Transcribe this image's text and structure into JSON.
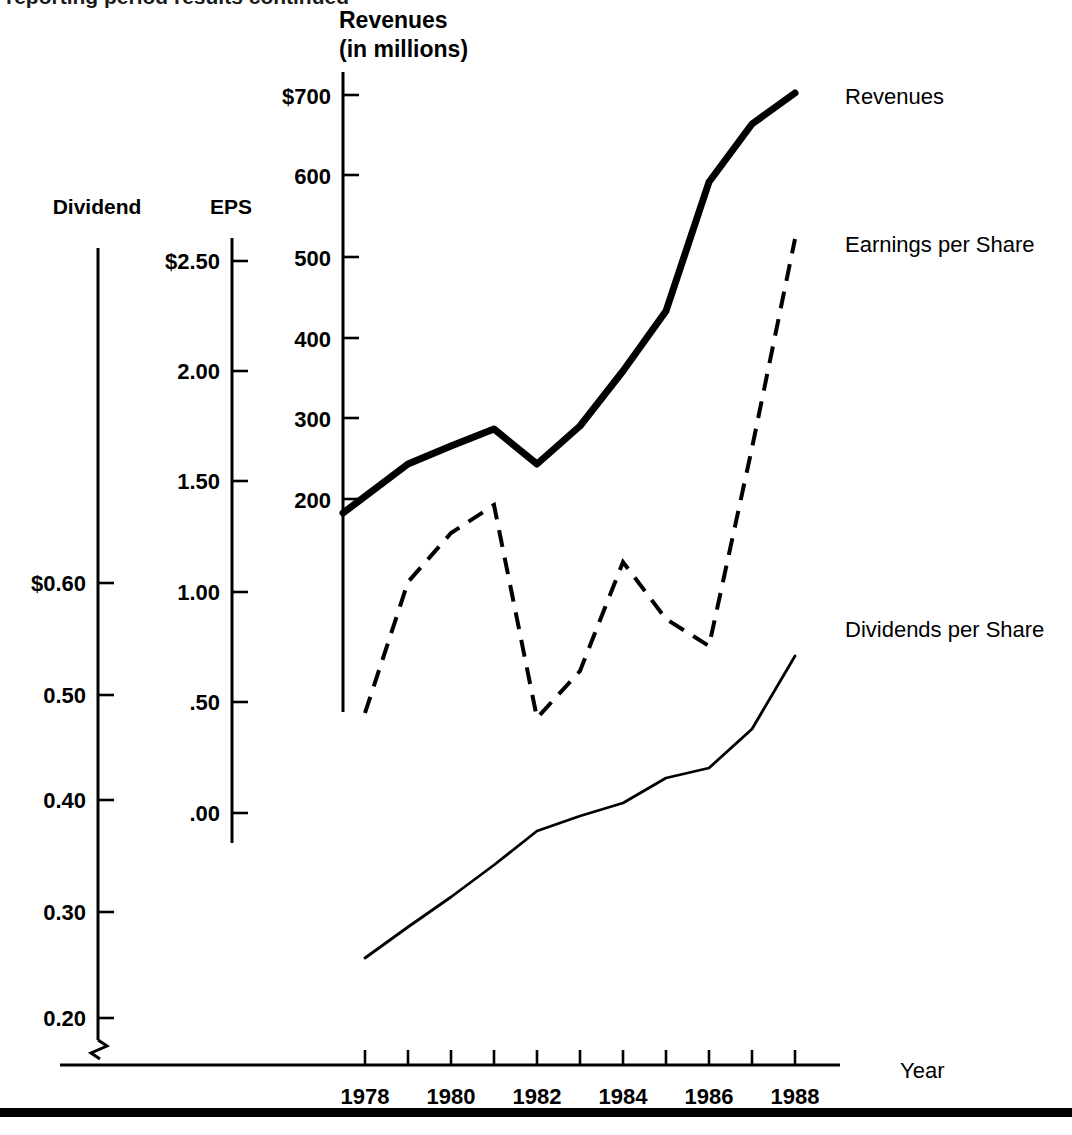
{
  "figure": {
    "background": "#ffffff",
    "ink_color": "#000000",
    "top_cropped_text": "reporting period results continued",
    "bottom_rule": {
      "y": 1108,
      "height": 9
    }
  },
  "axes": {
    "dividend": {
      "title": "Dividend",
      "title_x": 97,
      "title_y": 214,
      "axis_x": 98,
      "axis_top": 248,
      "axis_bottom": 1058,
      "has_break_symbol": true,
      "ticks": [
        {
          "label": "$0.60",
          "value": 0.6,
          "y": 583
        },
        {
          "label": "0.50",
          "value": 0.5,
          "y": 695
        },
        {
          "label": "0.40",
          "value": 0.4,
          "y": 800
        },
        {
          "label": "0.30",
          "value": 0.3,
          "y": 912
        },
        {
          "label": "0.20",
          "value": 0.2,
          "y": 1018
        }
      ]
    },
    "eps": {
      "title": "EPS",
      "title_x": 231,
      "title_y": 214,
      "axis_x": 232,
      "axis_top": 238,
      "axis_bottom": 843,
      "ticks": [
        {
          "label": "$2.50",
          "value": 2.5,
          "y": 261
        },
        {
          "label": "2.00",
          "value": 2.0,
          "y": 371
        },
        {
          "label": "1.50",
          "value": 1.5,
          "y": 481
        },
        {
          "label": "1.00",
          "value": 1.0,
          "y": 592
        },
        {
          "label": ".50",
          "value": 0.5,
          "y": 702
        },
        {
          "label": ".00",
          "value": 0.0,
          "y": 813
        }
      ]
    },
    "revenues": {
      "title_line1": "Revenues",
      "title_line2": "(in millions)",
      "title_x": 339,
      "title_y": 28,
      "axis_x": 343,
      "axis_top": 72,
      "axis_bottom": 712,
      "ticks": [
        {
          "label": "$700",
          "value": 700,
          "y": 95
        },
        {
          "label": "600",
          "value": 600,
          "y": 175
        },
        {
          "label": "500",
          "value": 500,
          "y": 257
        },
        {
          "label": "400",
          "value": 400,
          "y": 338
        },
        {
          "label": "300",
          "value": 300,
          "y": 418
        },
        {
          "label": "200",
          "value": 200,
          "y": 499
        }
      ]
    },
    "year": {
      "title": "Year",
      "title_x": 900,
      "title_y": 1078,
      "axis_y": 1065,
      "axis_left": 60,
      "axis_right": 840,
      "first_tick_x": 365,
      "tick_spacing": 43,
      "tick_count": 11,
      "labels": [
        "1978",
        "1980",
        "1982",
        "1984",
        "1986",
        "1988"
      ],
      "label_years": [
        1978,
        1980,
        1982,
        1984,
        1986,
        1988
      ],
      "label_y": 1104
    }
  },
  "series_labels": [
    {
      "name": "revenues-label",
      "text": "Revenues",
      "x": 845,
      "y": 104
    },
    {
      "name": "eps-label",
      "text": "Earnings per Share",
      "x": 845,
      "y": 252
    },
    {
      "name": "dividends-label",
      "text": "Dividends per Share",
      "x": 845,
      "y": 637
    }
  ],
  "chart_data": {
    "type": "line",
    "xlabel": "Year",
    "ylabel": "Revenues (in millions) / EPS / Dividend",
    "grid": false,
    "legend_position": "right-inline",
    "x": [
      1978,
      1979,
      1980,
      1981,
      1982,
      1983,
      1984,
      1985,
      1986,
      1987,
      1988
    ],
    "xlim": [
      1978,
      1988
    ],
    "series": [
      {
        "name": "Revenues",
        "style": "thick-solid",
        "axis": "revenues",
        "unit": "millions of dollars",
        "ylim": [
          150,
          740
        ],
        "values": [
          185,
          235,
          258,
          283,
          235,
          298,
          365,
          450,
          605,
          680,
          720
        ]
      },
      {
        "name": "Earnings per Share",
        "style": "dashed",
        "axis": "eps",
        "unit": "dollars per share",
        "ylim": [
          0.0,
          2.6
        ],
        "values": [
          0.45,
          1.1,
          1.33,
          1.45,
          0.46,
          0.65,
          1.12,
          0.82,
          0.7,
          1.6,
          2.62
        ]
      },
      {
        "name": "Dividends per Share",
        "style": "thin-solid",
        "axis": "dividend",
        "unit": "dollars per share",
        "ylim": [
          0.2,
          0.6
        ],
        "values": [
          0.258,
          0.288,
          0.316,
          0.346,
          0.379,
          0.393,
          0.402,
          0.425,
          0.434,
          0.47,
          0.533
        ]
      }
    ],
    "pixel_paths": {
      "revenues": "343,513 408,464 451,446 494,429 537,464 580,426 623,371 666,311 709,182 752,124 795,93",
      "eps": "365,713 408,582 451,533 494,505 537,718 580,671 623,562 666,619 709,646 752,448 795,239",
      "dividends": "365,958 408,927 451,897 494,865 537,831 580,816 623,803 666,778 709,768 752,729 795,656"
    }
  }
}
